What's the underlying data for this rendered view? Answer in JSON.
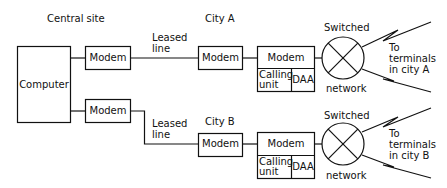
{
  "diagram": {
    "labels": {
      "central_site": "Central site",
      "city_a": "City A",
      "city_b": "City B",
      "leased_line_a_1": "Leased",
      "leased_line_a_2": "line",
      "leased_line_b_1": "Leased",
      "leased_line_b_2": "line",
      "switched_a": "Switched",
      "network_a": "network",
      "switched_b": "Switched",
      "network_b": "network",
      "terminals_a_1": "To",
      "terminals_a_2": "terminals",
      "terminals_a_3": "in city A",
      "terminals_b_1": "To",
      "terminals_b_2": "terminals",
      "terminals_b_3": "in city B"
    },
    "nodes": {
      "computer": "Computer",
      "central_modem_a": "Modem",
      "central_modem_b": "Modem",
      "city_a_modem": "Modem",
      "city_a_dial_modem": "Modem",
      "city_a_calling_unit_1": "Calling",
      "city_a_calling_unit_2": "unit",
      "city_a_daa": "DAA",
      "city_b_modem": "Modem",
      "city_b_dial_modem": "Modem",
      "city_b_calling_unit_1": "Calling",
      "city_b_calling_unit_2": "unit",
      "city_b_daa": "DAA"
    }
  }
}
